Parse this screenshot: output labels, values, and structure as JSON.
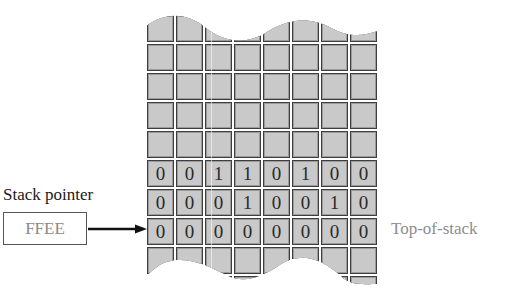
{
  "diagram": {
    "type": "stack-memory",
    "columns": 8,
    "rows": [
      {
        "bits": [
          "",
          "",
          "",
          "",
          "",
          "",
          "",
          ""
        ]
      },
      {
        "bits": [
          "",
          "",
          "",
          "",
          "",
          "",
          "",
          ""
        ]
      },
      {
        "bits": [
          "",
          "",
          "",
          "",
          "",
          "",
          "",
          ""
        ]
      },
      {
        "bits": [
          "",
          "",
          "",
          "",
          "",
          "",
          "",
          ""
        ]
      },
      {
        "bits": [
          "",
          "",
          "",
          "",
          "",
          "",
          "",
          ""
        ]
      },
      {
        "bits": [
          "0",
          "0",
          "1",
          "1",
          "0",
          "1",
          "0",
          "0"
        ]
      },
      {
        "bits": [
          "0",
          "0",
          "0",
          "1",
          "0",
          "0",
          "1",
          "0"
        ]
      },
      {
        "bits": [
          "0",
          "0",
          "0",
          "0",
          "0",
          "0",
          "0",
          "0"
        ]
      },
      {
        "bits": [
          "",
          "",
          "",
          "",
          "",
          "",
          "",
          ""
        ]
      },
      {
        "bits": [
          "",
          "",
          "",
          "",
          "",
          "",
          "",
          ""
        ]
      }
    ],
    "stack_pointer": {
      "label": "Stack pointer",
      "value": "FFEE"
    },
    "top_of_stack_label": "Top-of-stack",
    "pointed_row_index": 7
  },
  "colors": {
    "cell_border": "#3e3e3e",
    "cell_bevel": "#9c9c9c",
    "cell_fill": "#c9c9c9",
    "label_gray": "#8d8d8d",
    "arrow": "#111111"
  }
}
